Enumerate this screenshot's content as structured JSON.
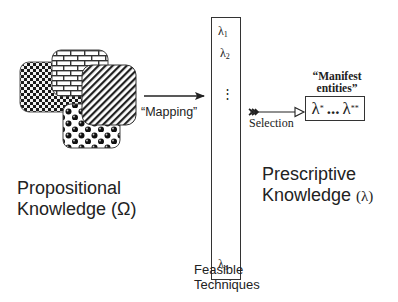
{
  "diagram": {
    "left": {
      "shapes": [
        {
          "name": "checkered-region",
          "pattern": "checkerboard"
        },
        {
          "name": "brick-region",
          "pattern": "brick"
        },
        {
          "name": "striped-region",
          "pattern": "diagonal-stripes"
        },
        {
          "name": "dotted-region",
          "pattern": "spheres"
        }
      ],
      "label_line1": "Propositional",
      "label_line2": "Knowledge",
      "label_symbol": "(Ω)"
    },
    "mapping": {
      "label": "“Mapping”"
    },
    "techniques": {
      "items": [
        {
          "base": "λ",
          "sub": "1"
        },
        {
          "base": "λ",
          "sub": "2"
        },
        {
          "base": "⋮",
          "sub": ""
        },
        {
          "base": "λ",
          "sub": "n"
        }
      ],
      "label_line1": "Feasible",
      "label_line2": "Techniques"
    },
    "selection": {
      "label": "Selection"
    },
    "manifest": {
      "title_line1": "“Manifest",
      "title_line2": "entities”",
      "first": "λ",
      "first_sup": "*",
      "ellipsis": "...",
      "last": "λ",
      "last_sup": "**"
    },
    "right": {
      "label_line1": "Prescriptive",
      "label_line2": "Knowledge",
      "label_symbol": "(λ)"
    }
  }
}
